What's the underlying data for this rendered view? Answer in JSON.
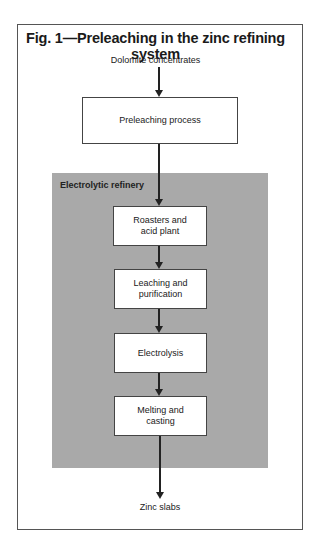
{
  "figure": {
    "title": "Fig. 1—Preleaching in the zinc refining system",
    "input_label": "Dolomite concentrates",
    "output_label": "Zinc slabs",
    "region_label": "Electrolytic refinery",
    "steps": [
      {
        "label": "Preleaching process"
      },
      {
        "label": "Roasters and\nacid plant"
      },
      {
        "label": "Leaching and\npurification"
      },
      {
        "label": "Electrolysis"
      },
      {
        "label": "Melting and\ncasting"
      }
    ],
    "colors": {
      "region_fill": "#a9a9a9",
      "box_fill": "#ffffff",
      "line": "#222222"
    }
  }
}
